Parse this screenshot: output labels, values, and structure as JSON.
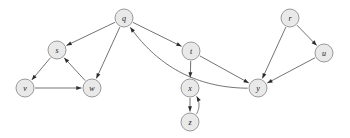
{
  "diagram": {
    "type": "directed-graph",
    "background_color": "#ffffff",
    "node_fill_color": "#e9e9e9",
    "node_stroke_color": "#8f8f8f",
    "edge_color": "#5a5a5a",
    "arrow_color": "#2b2b2b",
    "node_radius": 9,
    "nodes": [
      {
        "id": "q",
        "label": "q",
        "x": 124,
        "y": 18
      },
      {
        "id": "s",
        "label": "s",
        "x": 57,
        "y": 50
      },
      {
        "id": "v",
        "label": "v",
        "x": 25,
        "y": 88
      },
      {
        "id": "w",
        "label": "w",
        "x": 92,
        "y": 88
      },
      {
        "id": "t",
        "label": "t",
        "x": 191,
        "y": 51
      },
      {
        "id": "x",
        "label": "x",
        "x": 190,
        "y": 88
      },
      {
        "id": "z",
        "label": "z",
        "x": 190,
        "y": 122
      },
      {
        "id": "y",
        "label": "y",
        "x": 258,
        "y": 88
      },
      {
        "id": "r",
        "label": "r",
        "x": 290,
        "y": 18
      },
      {
        "id": "u",
        "label": "u",
        "x": 324,
        "y": 53
      }
    ],
    "edges": [
      {
        "from": "q",
        "to": "s",
        "curved": false
      },
      {
        "from": "q",
        "to": "w",
        "curved": false
      },
      {
        "from": "q",
        "to": "t",
        "curved": false
      },
      {
        "from": "s",
        "to": "v",
        "curved": false
      },
      {
        "from": "v",
        "to": "w",
        "curved": false
      },
      {
        "from": "w",
        "to": "s",
        "curved": false
      },
      {
        "from": "t",
        "to": "x",
        "curved": false
      },
      {
        "from": "t",
        "to": "y",
        "curved": false
      },
      {
        "from": "x",
        "to": "z",
        "curved": false
      },
      {
        "from": "z",
        "to": "x",
        "curved": true,
        "bow": 9
      },
      {
        "from": "y",
        "to": "q",
        "curved": true,
        "bow": -22
      },
      {
        "from": "r",
        "to": "y",
        "curved": false
      },
      {
        "from": "r",
        "to": "u",
        "curved": false
      },
      {
        "from": "u",
        "to": "y",
        "curved": false
      }
    ]
  }
}
